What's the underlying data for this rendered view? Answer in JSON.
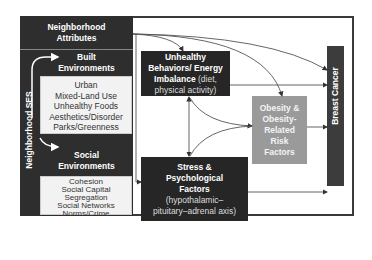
{
  "diagram": {
    "neighborhood_attributes": {
      "title_line1": "Neighborhood",
      "title_line2": "Attributes",
      "side_label": "Neighborhood SES",
      "built": {
        "header_line1": "Built",
        "header_line2": "Environments",
        "items": [
          "Urban",
          "Mixed-Land Use",
          "Unhealthy Foods",
          "Aesthetics/Disorder",
          "Parks/Greenness"
        ]
      },
      "social": {
        "header_line1": "Social",
        "header_line2": "Environments",
        "items": [
          "Cohesion",
          "Social Capital",
          "Segregation",
          "Social Networks",
          "Norms/Crime"
        ]
      }
    },
    "behaviors": {
      "line1": "Unhealthy",
      "line2": "Behaviors/ Energy",
      "line3_bold": "Imbalance",
      "line3_light": " (diet,",
      "line4": "physical activity)"
    },
    "stress": {
      "line1": "Stress &",
      "line2": "Psychological",
      "line3": "Factors",
      "line4": "(hypothalamic–",
      "line5": "pituitary–adrenal axis)"
    },
    "obesity": {
      "line1": "Obesity &",
      "line2": "Obesity-",
      "line3": "Related",
      "line4": "Risk",
      "line5": "Factors"
    },
    "outcome": {
      "label": "Breast Cancer"
    },
    "colors": {
      "dark_box": "#262626",
      "panel": "#2e2e2e",
      "obesity_box": "#9a9a9a",
      "outcome_bar": "#3c3c3c",
      "list_bg": "#f2f2f2",
      "arrow": "#555555"
    }
  }
}
